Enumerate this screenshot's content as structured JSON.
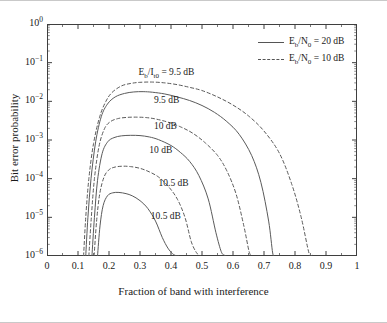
{
  "chart_data": {
    "type": "line",
    "title": "",
    "xlabel": "Fraction of band with interference",
    "ylabel": "Bit error probability",
    "xlim": [
      0,
      1
    ],
    "ylim": [
      1e-06,
      1
    ],
    "yscale": "log",
    "grid": false,
    "legend_position": "top-right",
    "xticks": [
      "0",
      "0.1",
      "0.2",
      "0.3",
      "0.4",
      "0.5",
      "0.6",
      "0.7",
      "0.8",
      "0.9",
      "1"
    ],
    "xtick_values": [
      0,
      0.1,
      0.2,
      0.3,
      0.4,
      0.5,
      0.6,
      0.7,
      0.8,
      0.9,
      1
    ],
    "yticks": [
      "10^0",
      "10^-1",
      "10^-2",
      "10^-3",
      "10^-4",
      "10^-5",
      "10^-6"
    ],
    "ytick_mantissa": "10",
    "ytick_exponents": [
      "0",
      "−1",
      "−2",
      "−3",
      "−4",
      "−5",
      "−6"
    ],
    "ytick_values": [
      1,
      0.1,
      0.01,
      0.001,
      0.0001,
      1e-05,
      1e-06
    ],
    "legend": [
      {
        "label_prefix": "E",
        "label_sub1": "b",
        "label_mid": "/N",
        "label_sub2": "0",
        "label_suffix": " = 20 dB",
        "style": "solid",
        "text": "Eb/N0 = 20 dB"
      },
      {
        "label_prefix": "E",
        "label_sub1": "b",
        "label_mid": "/N",
        "label_sub2": "0",
        "label_suffix": " = 10 dB",
        "style": "dashed",
        "text": "Eb/N0 = 10 dB"
      }
    ],
    "annotations": [
      {
        "text": "Eb/It0 = 9.5 dB",
        "x": 0.295,
        "y": 0.055,
        "prefix": "E",
        "sub1": "b",
        "mid": "/I",
        "sub2": "t0",
        "suffix": " = 9.5 dB"
      },
      {
        "text": "9.5 dB",
        "x": 0.345,
        "y": 0.0105,
        "prefix": "",
        "sub1": "",
        "mid": "",
        "sub2": "",
        "suffix": "9.5 dB"
      },
      {
        "text": "10 dB",
        "x": 0.345,
        "y": 0.0022,
        "prefix": "",
        "sub1": "",
        "mid": "",
        "sub2": "",
        "suffix": "10 dB"
      },
      {
        "text": "10 dB",
        "x": 0.33,
        "y": 0.00052,
        "prefix": "",
        "sub1": "",
        "mid": "",
        "sub2": "",
        "suffix": "10 dB"
      },
      {
        "text": "10.5 dB",
        "x": 0.36,
        "y": 7.2e-05,
        "prefix": "",
        "sub1": "",
        "mid": "",
        "sub2": "",
        "suffix": "10.5 dB"
      },
      {
        "text": "10.5 dB",
        "x": 0.335,
        "y": 1.05e-05,
        "prefix": "",
        "sub1": "",
        "mid": "",
        "sub2": "",
        "suffix": "10.5 dB"
      }
    ],
    "series": [
      {
        "name": "Eb/It0 = 9.5 dB, Eb/N0 = 10 dB",
        "style": "dashed",
        "ratio_db": 9.5,
        "ebno_db": 10,
        "x": [
          0.118,
          0.125,
          0.135,
          0.15,
          0.17,
          0.19,
          0.21,
          0.24,
          0.27,
          0.3,
          0.34,
          0.38,
          0.42,
          0.46,
          0.5,
          0.55,
          0.6,
          0.65,
          0.7,
          0.75,
          0.79,
          0.82,
          0.845,
          0.855,
          0.862
        ],
        "y": [
          1e-06,
          1e-05,
          0.0001,
          0.0008,
          0.004,
          0.01,
          0.017,
          0.025,
          0.029,
          0.031,
          0.0315,
          0.03,
          0.027,
          0.023,
          0.019,
          0.013,
          0.008,
          0.0042,
          0.0017,
          0.00045,
          7e-05,
          1e-05,
          1.2e-06,
          1.05e-06,
          1e-06
        ]
      },
      {
        "name": "Eb/It0 = 9.5 dB, Eb/N0 = 20 dB",
        "style": "solid",
        "ratio_db": 9.5,
        "ebno_db": 20,
        "x": [
          0.125,
          0.132,
          0.142,
          0.157,
          0.175,
          0.195,
          0.22,
          0.25,
          0.28,
          0.31,
          0.34,
          0.38,
          0.42,
          0.46,
          0.5,
          0.54,
          0.58,
          0.62,
          0.66,
          0.69,
          0.715,
          0.728,
          0.735
        ],
        "y": [
          1e-06,
          1e-05,
          0.0001,
          0.0009,
          0.004,
          0.0085,
          0.013,
          0.016,
          0.0175,
          0.0178,
          0.0172,
          0.0155,
          0.013,
          0.0105,
          0.0078,
          0.0052,
          0.003,
          0.0014,
          0.0004,
          8e-05,
          8e-06,
          1.2e-06,
          1e-06
        ]
      },
      {
        "name": "Eb/It0 = 10 dB, Eb/N0 = 10 dB",
        "style": "dashed",
        "ratio_db": 10,
        "ebno_db": 10,
        "x": [
          0.135,
          0.143,
          0.153,
          0.168,
          0.186,
          0.205,
          0.23,
          0.26,
          0.29,
          0.32,
          0.35,
          0.39,
          0.43,
          0.47,
          0.51,
          0.55,
          0.58,
          0.61,
          0.635,
          0.652,
          0.661
        ],
        "y": [
          1e-06,
          1e-05,
          0.0001,
          0.0007,
          0.002,
          0.003,
          0.0036,
          0.00385,
          0.0039,
          0.0038,
          0.0035,
          0.0029,
          0.0022,
          0.0015,
          0.00085,
          0.0004,
          0.00016,
          4e-05,
          6e-06,
          1.3e-06,
          1e-06
        ]
      },
      {
        "name": "Eb/It0 = 10 dB, Eb/N0 = 20 dB",
        "style": "solid",
        "ratio_db": 10,
        "ebno_db": 20,
        "x": [
          0.145,
          0.153,
          0.163,
          0.178,
          0.196,
          0.216,
          0.24,
          0.27,
          0.3,
          0.33,
          0.36,
          0.4,
          0.43,
          0.46,
          0.49,
          0.52,
          0.545,
          0.562,
          0.572,
          0.578
        ],
        "y": [
          1e-06,
          1e-05,
          9e-05,
          0.00045,
          0.0009,
          0.00115,
          0.00128,
          0.00132,
          0.0013,
          0.0012,
          0.00102,
          0.00072,
          0.00048,
          0.00028,
          0.00012,
          3e-05,
          4e-06,
          1.3e-06,
          1.05e-06,
          1e-06
        ]
      },
      {
        "name": "Eb/It0 = 10.5 dB, Eb/N0 = 10 dB",
        "style": "dashed",
        "ratio_db": 10.5,
        "ebno_db": 10,
        "x": [
          0.152,
          0.16,
          0.17,
          0.184,
          0.2,
          0.22,
          0.245,
          0.27,
          0.3,
          0.33,
          0.36,
          0.39,
          0.42,
          0.445,
          0.465,
          0.48,
          0.49,
          0.496
        ],
        "y": [
          1e-06,
          8e-06,
          4e-05,
          0.00011,
          0.00017,
          0.0002,
          0.00021,
          0.000205,
          0.000185,
          0.00015,
          0.00011,
          6.5e-05,
          3e-05,
          1e-05,
          2.4e-06,
          1.3e-06,
          1.05e-06,
          1e-06
        ]
      },
      {
        "name": "Eb/It0 = 10.5 dB, Eb/N0 = 20 dB",
        "style": "solid",
        "ratio_db": 10.5,
        "ebno_db": 20,
        "x": [
          0.163,
          0.171,
          0.181,
          0.195,
          0.212,
          0.232,
          0.255,
          0.275,
          0.3,
          0.325,
          0.35,
          0.372,
          0.39,
          0.405,
          0.415,
          0.421,
          0.425
        ],
        "y": [
          1e-06,
          6e-06,
          2e-05,
          3.6e-05,
          4.3e-05,
          4.4e-05,
          4.1e-05,
          3.6e-05,
          2.7e-05,
          1.7e-05,
          8e-06,
          3e-06,
          1.6e-06,
          1.15e-06,
          1.03e-06,
          1e-06,
          1e-06
        ]
      }
    ]
  },
  "colors": {
    "axis": "#3f3f3f",
    "curve": "#5a5a5a",
    "text": "#1a1a1a",
    "background": "#ffffff",
    "page_rule": "#c9c9c9"
  }
}
